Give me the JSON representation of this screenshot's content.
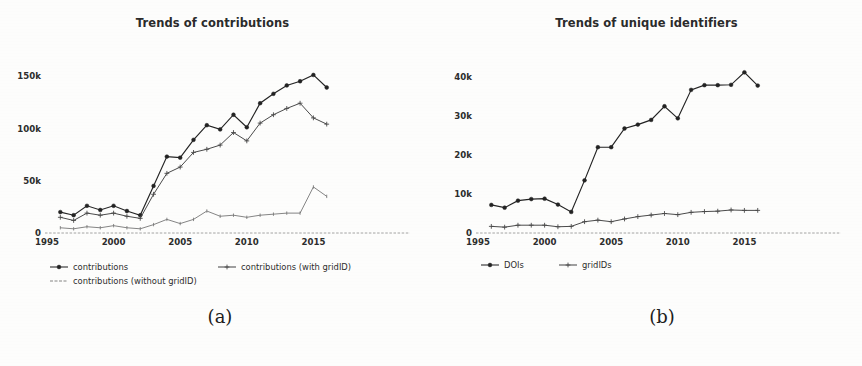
{
  "figure": {
    "width": 862,
    "height": 366,
    "background": "#fdfdfc",
    "ink_color": "#2d2d2d",
    "subcaption_a": "(a)",
    "subcaption_b": "(b)"
  },
  "chart_data": [
    {
      "panel": "(a)",
      "type": "line",
      "title": "Trends of contributions",
      "xlabel": "",
      "ylabel": "",
      "xlim": [
        1995,
        2017
      ],
      "ylim": [
        0,
        160000
      ],
      "xticks": [
        1995,
        2000,
        2005,
        2010,
        2015
      ],
      "xtick_labels": [
        "1995",
        "2000",
        "2005",
        "2010",
        "2015"
      ],
      "yticks": [
        0,
        50000,
        100000,
        150000
      ],
      "ytick_labels": [
        "0",
        "50k",
        "100k",
        "150k"
      ],
      "grid": false,
      "legend_position": "below",
      "x": [
        1996,
        1997,
        1998,
        1999,
        2000,
        2001,
        2002,
        2003,
        2004,
        2005,
        2006,
        2007,
        2008,
        2009,
        2010,
        2011,
        2012,
        2013,
        2014,
        2015,
        2016
      ],
      "series": [
        {
          "name": "contributions",
          "marker": "circle",
          "values": [
            20000,
            17000,
            26000,
            22000,
            26000,
            21000,
            17000,
            45000,
            73000,
            72000,
            89000,
            103000,
            99000,
            113000,
            101000,
            124000,
            133000,
            141000,
            145000,
            151000,
            139000
          ]
        },
        {
          "name": "contributions (with gridID)",
          "marker": "plus",
          "values": [
            15000,
            12000,
            19000,
            17000,
            19000,
            16000,
            14000,
            37000,
            57000,
            63000,
            77000,
            80000,
            84000,
            96000,
            88000,
            105000,
            113000,
            119000,
            124000,
            110000,
            104000
          ]
        },
        {
          "name": "contributions (without gridID)",
          "marker": "tick",
          "values": [
            5000,
            4000,
            6000,
            5000,
            7000,
            5000,
            4000,
            8000,
            13000,
            9000,
            13000,
            21000,
            16000,
            17000,
            15000,
            17000,
            18000,
            19000,
            19000,
            44000,
            35000
          ]
        }
      ]
    },
    {
      "panel": "(b)",
      "type": "line",
      "title": "Trends of unique identifiers",
      "xlabel": "",
      "ylabel": "",
      "xlim": [
        1995,
        2017
      ],
      "ylim": [
        0,
        44000
      ],
      "xticks": [
        1995,
        2000,
        2005,
        2010,
        2015
      ],
      "xtick_labels": [
        "1995",
        "2000",
        "2005",
        "2010",
        "2015"
      ],
      "yticks": [
        0,
        10000,
        20000,
        30000,
        40000
      ],
      "ytick_labels": [
        "0",
        "10k",
        "20k",
        "30k",
        "40k"
      ],
      "grid": false,
      "legend_position": "below",
      "x": [
        1996,
        1997,
        1998,
        1999,
        2000,
        2001,
        2002,
        2003,
        2004,
        2005,
        2006,
        2007,
        2008,
        2009,
        2010,
        2011,
        2012,
        2013,
        2014,
        2015,
        2016
      ],
      "series": [
        {
          "name": "DOIs",
          "marker": "circle",
          "values": [
            7200,
            6500,
            8300,
            8700,
            8800,
            7300,
            5400,
            13500,
            22000,
            22000,
            26800,
            27800,
            29000,
            32500,
            29400,
            36700,
            37900,
            37900,
            38000,
            41200,
            37800
          ]
        },
        {
          "name": "gridIDs",
          "marker": "plus",
          "values": [
            1700,
            1500,
            2000,
            2000,
            2000,
            1600,
            1700,
            2900,
            3300,
            2900,
            3600,
            4200,
            4600,
            5000,
            4700,
            5300,
            5500,
            5600,
            5900,
            5800,
            5800
          ]
        }
      ]
    }
  ],
  "legends": {
    "panel_a": [
      {
        "label": "contributions",
        "marker": "circle"
      },
      {
        "label": "contributions (with gridID)",
        "marker": "plus"
      },
      {
        "label": "contributions (without gridID)",
        "marker": "tick"
      }
    ],
    "panel_b": [
      {
        "label": "DOIs",
        "marker": "circle"
      },
      {
        "label": "gridIDs",
        "marker": "plus"
      }
    ]
  }
}
